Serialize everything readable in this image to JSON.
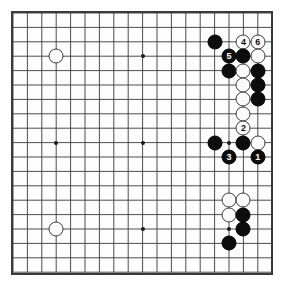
{
  "board": {
    "title": "Go board diagram",
    "size": 19,
    "line_color": "#3a3a3a",
    "board_color": "#fdfdfd",
    "black_color": "#0d0d0d",
    "white_color": "#fbfbfb",
    "origin_x": 13,
    "origin_y": 13,
    "spacing": 14.4,
    "star_points": [
      {
        "col": 3,
        "row": 3
      },
      {
        "col": 9,
        "row": 3
      },
      {
        "col": 15,
        "row": 3
      },
      {
        "col": 3,
        "row": 9
      },
      {
        "col": 9,
        "row": 9
      },
      {
        "col": 15,
        "row": 9
      },
      {
        "col": 3,
        "row": 15
      },
      {
        "col": 9,
        "row": 15
      },
      {
        "col": 15,
        "row": 15
      }
    ],
    "stones": [
      {
        "col": 3,
        "row": 3,
        "color": "white",
        "label": ""
      },
      {
        "col": 3,
        "row": 15,
        "color": "white",
        "label": ""
      },
      {
        "col": 14,
        "row": 2,
        "color": "black",
        "label": ""
      },
      {
        "col": 16,
        "row": 2,
        "color": "white",
        "label": "4"
      },
      {
        "col": 17,
        "row": 2,
        "color": "white",
        "label": "6"
      },
      {
        "col": 15,
        "row": 3,
        "color": "black",
        "label": "5"
      },
      {
        "col": 16,
        "row": 3,
        "color": "black",
        "label": ""
      },
      {
        "col": 17,
        "row": 3,
        "color": "white",
        "label": ""
      },
      {
        "col": 15,
        "row": 4,
        "color": "black",
        "label": ""
      },
      {
        "col": 16,
        "row": 4,
        "color": "white",
        "label": ""
      },
      {
        "col": 17,
        "row": 4,
        "color": "black",
        "label": ""
      },
      {
        "col": 16,
        "row": 5,
        "color": "white",
        "label": ""
      },
      {
        "col": 17,
        "row": 5,
        "color": "black",
        "label": ""
      },
      {
        "col": 16,
        "row": 6,
        "color": "white",
        "label": ""
      },
      {
        "col": 17,
        "row": 6,
        "color": "black",
        "label": ""
      },
      {
        "col": 16,
        "row": 7,
        "color": "white",
        "label": ""
      },
      {
        "col": 16,
        "row": 8,
        "color": "white",
        "label": "2"
      },
      {
        "col": 14,
        "row": 9,
        "color": "black",
        "label": ""
      },
      {
        "col": 16,
        "row": 9,
        "color": "black",
        "label": ""
      },
      {
        "col": 17,
        "row": 9,
        "color": "white",
        "label": ""
      },
      {
        "col": 15,
        "row": 10,
        "color": "black",
        "label": "3"
      },
      {
        "col": 17,
        "row": 10,
        "color": "black",
        "label": "1"
      },
      {
        "col": 15,
        "row": 13,
        "color": "white",
        "label": ""
      },
      {
        "col": 16,
        "row": 13,
        "color": "white",
        "label": ""
      },
      {
        "col": 15,
        "row": 14,
        "color": "white",
        "label": ""
      },
      {
        "col": 16,
        "row": 14,
        "color": "black",
        "label": ""
      },
      {
        "col": 16,
        "row": 15,
        "color": "black",
        "label": ""
      },
      {
        "col": 15,
        "row": 16,
        "color": "black",
        "label": ""
      }
    ]
  }
}
